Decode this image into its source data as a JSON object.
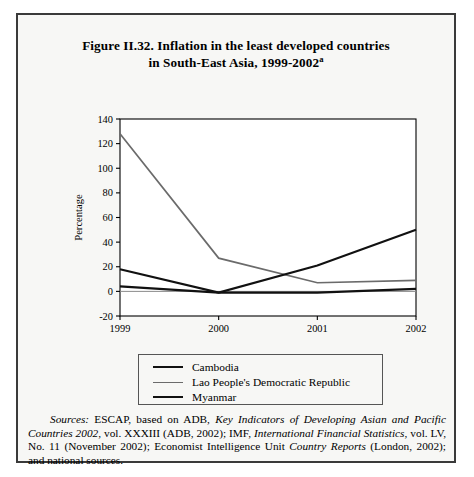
{
  "figure": {
    "title_line1": "Figure II.32.   Inflation in the least developed countries",
    "title_line2": "in South-East Asia, 1999-2002",
    "title_superscript": "a"
  },
  "chart_data": {
    "type": "line",
    "title": "Figure II.32. Inflation in the least developed countries in South-East Asia, 1999-2002",
    "xlabel": "",
    "ylabel": "Percentage",
    "categories": [
      "1999",
      "2000",
      "2001",
      "2002"
    ],
    "x_tick_labels": [
      "1999",
      "2000",
      "2001",
      "2002"
    ],
    "y_tick_labels": [
      "-20",
      "0",
      "20",
      "40",
      "60",
      "80",
      "100",
      "120",
      "140"
    ],
    "y_ticks": [
      -20,
      0,
      20,
      40,
      60,
      80,
      100,
      120,
      140
    ],
    "ylim": [
      -20,
      140
    ],
    "grid": false,
    "legend_position": "below",
    "series": [
      {
        "name": "Cambodia",
        "values": [
          4,
          -1,
          -1,
          2
        ],
        "color": "#111111",
        "width": 2.2
      },
      {
        "name": "Lao People's Democratic Republic",
        "values": [
          128,
          27,
          7,
          9
        ],
        "color": "#6b6b6b",
        "width": 1.7
      },
      {
        "name": "Myanmar",
        "values": [
          18,
          -1,
          21,
          50
        ],
        "color": "#111111",
        "width": 2.2
      }
    ]
  },
  "legend": {
    "items": [
      {
        "label": "Cambodia"
      },
      {
        "label": "Lao People's Democratic Republic"
      },
      {
        "label": "Myanmar"
      }
    ]
  },
  "source": {
    "label": "Sources:",
    "text_1": "  ESCAP, based on ADB, ",
    "italic_1": "Key Indicators of Developing Asian and Pacific Countries 2002",
    "text_2": ", vol. XXXIII (ADB, 2002); IMF, ",
    "italic_2": "International Financial Statistics",
    "text_3": ", vol. LV, No. 11 (November 2002); Economist Intelligence Unit ",
    "italic_3": "Country Reports",
    "text_4": " (London, 2002); and national sources."
  }
}
